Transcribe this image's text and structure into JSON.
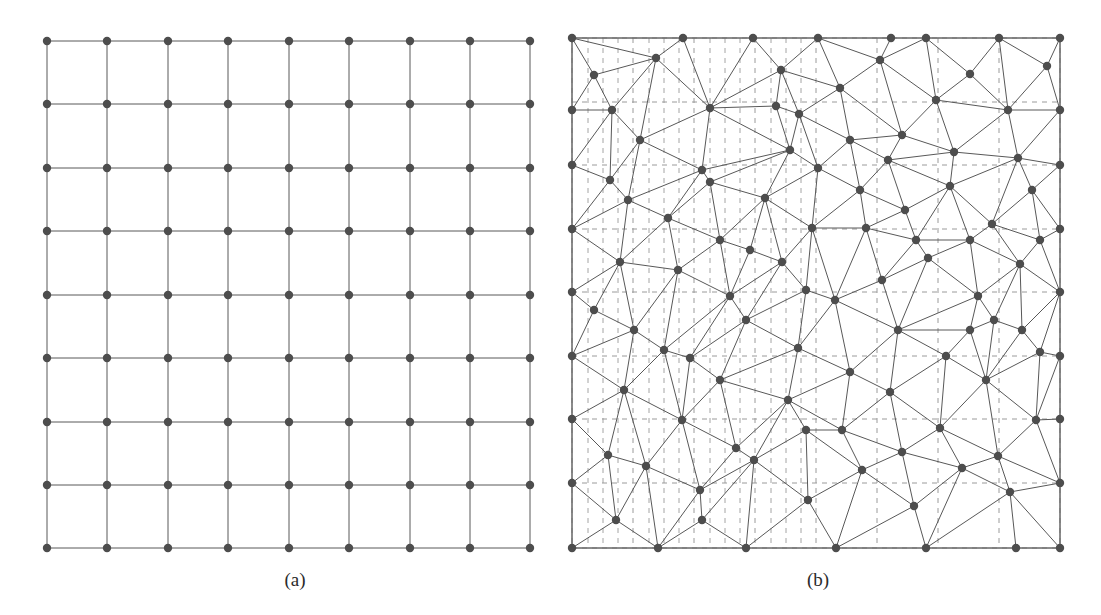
{
  "figure": {
    "background_color": "#ffffff",
    "node_color": "#4d4d4d",
    "edge_color": "#585858",
    "dash_grid_color": "#9a9a9a",
    "border_color": "#8a8a8a",
    "node_radius": 4.2,
    "edge_width": 1.0
  },
  "panels": [
    {
      "id": "a",
      "caption": "(a)",
      "kind": "structured-grid",
      "description": "Uniform Cartesian 9 by 9 node grid",
      "node_count": 81,
      "rows": 9,
      "cols": 9,
      "bounds": {
        "x0": 47,
        "y0": 41,
        "x1": 530,
        "y1": 548
      },
      "x_coords": [
        47,
        107,
        168,
        228,
        289,
        349,
        410,
        470,
        530
      ],
      "y_coords": [
        41,
        104,
        168,
        231,
        295,
        358,
        422,
        485,
        548
      ]
    },
    {
      "id": "b",
      "caption": "(b)",
      "kind": "unstructured-triangular-mesh",
      "description": "Delaunay style triangulation over a dashed Cartesian reference grid",
      "node_count": 113,
      "bounds": {
        "x0": 22,
        "y0": 38,
        "x1": 510,
        "y1": 548
      },
      "dash_grid": {
        "x_coords": [
          22,
          83,
          144,
          205,
          266,
          327,
          388,
          449,
          510
        ],
        "y_coords": [
          38,
          102,
          165,
          229,
          292,
          356,
          419,
          483,
          548
        ],
        "extra_vertical_x": [
          38,
          53,
          68,
          99,
          114,
          129,
          160,
          175,
          190,
          221,
          236,
          251
        ],
        "dash_pattern": "5 5"
      },
      "nodes": [
        [
          22,
          38
        ],
        [
          106,
          58
        ],
        [
          160,
          108
        ],
        [
          22,
          165
        ],
        [
          90,
          140
        ],
        [
          133,
          38
        ],
        [
          160,
          182
        ],
        [
          231,
          70
        ],
        [
          203,
          38
        ],
        [
          249,
          114
        ],
        [
          268,
          38
        ],
        [
          290,
          88
        ],
        [
          330,
          60
        ],
        [
          341,
          38
        ],
        [
          386,
          100
        ],
        [
          376,
          38
        ],
        [
          420,
          74
        ],
        [
          449,
          38
        ],
        [
          458,
          110
        ],
        [
          497,
          66
        ],
        [
          510,
          38
        ],
        [
          510,
          110
        ],
        [
          22,
          110
        ],
        [
          62,
          110
        ],
        [
          240,
          150
        ],
        [
          300,
          140
        ],
        [
          352,
          135
        ],
        [
          404,
          152
        ],
        [
          468,
          158
        ],
        [
          510,
          165
        ],
        [
          22,
          229
        ],
        [
          78,
          200
        ],
        [
          118,
          218
        ],
        [
          170,
          240
        ],
        [
          215,
          198
        ],
        [
          262,
          228
        ],
        [
          310,
          190
        ],
        [
          355,
          210
        ],
        [
          400,
          186
        ],
        [
          442,
          224
        ],
        [
          482,
          190
        ],
        [
          510,
          229
        ],
        [
          22,
          292
        ],
        [
          70,
          262
        ],
        [
          128,
          270
        ],
        [
          180,
          296
        ],
        [
          232,
          262
        ],
        [
          285,
          300
        ],
        [
          332,
          280
        ],
        [
          378,
          258
        ],
        [
          428,
          296
        ],
        [
          470,
          264
        ],
        [
          510,
          292
        ],
        [
          22,
          356
        ],
        [
          84,
          330
        ],
        [
          140,
          358
        ],
        [
          196,
          320
        ],
        [
          248,
          348
        ],
        [
          300,
          372
        ],
        [
          348,
          330
        ],
        [
          396,
          356
        ],
        [
          444,
          320
        ],
        [
          490,
          352
        ],
        [
          510,
          356
        ],
        [
          22,
          419
        ],
        [
          74,
          390
        ],
        [
          132,
          420
        ],
        [
          186,
          448
        ],
        [
          238,
          400
        ],
        [
          292,
          430
        ],
        [
          340,
          392
        ],
        [
          390,
          428
        ],
        [
          436,
          380
        ],
        [
          486,
          420
        ],
        [
          510,
          419
        ],
        [
          22,
          483
        ],
        [
          96,
          466
        ],
        [
          150,
          490
        ],
        [
          204,
          460
        ],
        [
          258,
          500
        ],
        [
          312,
          470
        ],
        [
          364,
          506
        ],
        [
          412,
          468
        ],
        [
          460,
          492
        ],
        [
          510,
          483
        ],
        [
          22,
          548
        ],
        [
          108,
          548
        ],
        [
          196,
          548
        ],
        [
          286,
          548
        ],
        [
          376,
          548
        ],
        [
          466,
          548
        ],
        [
          510,
          548
        ],
        [
          58,
          455
        ],
        [
          44,
          310
        ],
        [
          152,
          170
        ],
        [
          226,
          106
        ],
        [
          316,
          228
        ],
        [
          420,
          240
        ],
        [
          60,
          180
        ],
        [
          114,
          350
        ],
        [
          268,
          168
        ],
        [
          352,
          452
        ],
        [
          448,
          456
        ],
        [
          170,
          380
        ],
        [
          256,
          290
        ],
        [
          338,
          160
        ],
        [
          420,
          330
        ],
        [
          490,
          240
        ],
        [
          66,
          520
        ],
        [
          152,
          520
        ],
        [
          256,
          430
        ],
        [
          366,
          240
        ],
        [
          472,
          330
        ],
        [
          44,
          75
        ],
        [
          200,
          250
        ]
      ]
    }
  ]
}
